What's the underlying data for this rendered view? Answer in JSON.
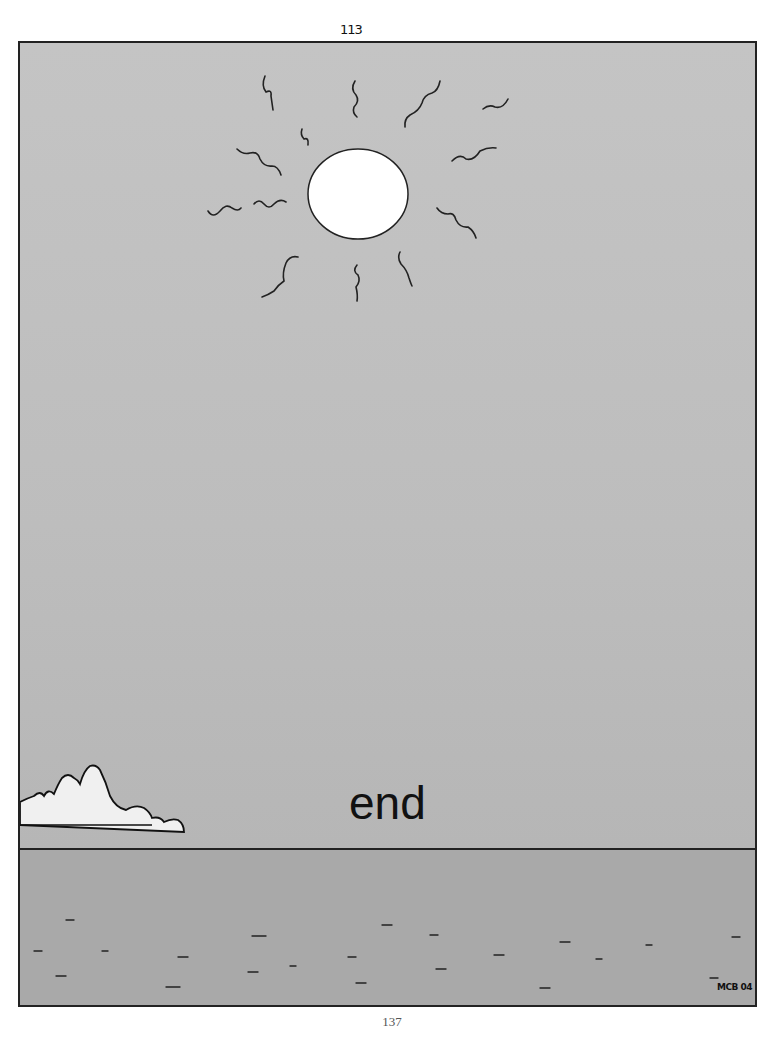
{
  "page": {
    "hand_number": "113",
    "printed_page_number": "137"
  },
  "panel": {
    "caption": "end",
    "signature": "MCB 04",
    "elements": [
      "sun-with-wavy-rays",
      "cloud",
      "horizon",
      "sea-with-dashes"
    ]
  },
  "colors": {
    "sky": "#c0c0c0",
    "sea": "#a9a9a9",
    "ink": "#222222",
    "sun": "#ffffff"
  }
}
